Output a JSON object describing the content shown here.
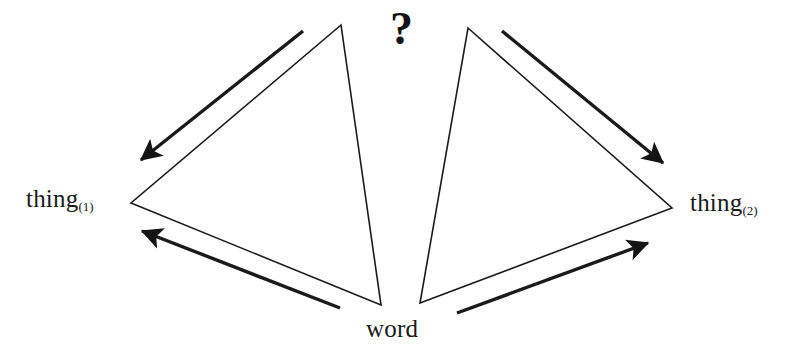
{
  "diagram": {
    "type": "dual-triangle-reference-diagram",
    "background_color": "#ffffff",
    "stroke_color": "#1a1a1a",
    "nodes": {
      "thing1": {
        "base": "thing",
        "subscript": "(1)",
        "full": "thing(1)"
      },
      "thing2": {
        "base": "thing",
        "subscript": "(2)",
        "full": "thing(2)"
      },
      "word": {
        "base": "word"
      },
      "question": {
        "symbol": "?"
      }
    },
    "thin_triangles": [
      {
        "name": "left-triangle",
        "points": "341,25 131,203 381,305"
      },
      {
        "name": "right-triangle",
        "points": "468,28 672,208 420,303"
      }
    ],
    "arrows": [
      {
        "name": "arrow-upper-left",
        "from": "word-apex",
        "to": "thing1",
        "x1": 303,
        "y1": 31,
        "x2": 141,
        "y2": 160
      },
      {
        "name": "arrow-lower-left",
        "from": "word",
        "to": "thing1",
        "x1": 340,
        "y1": 308,
        "x2": 142,
        "y2": 231
      },
      {
        "name": "arrow-upper-right",
        "from": "word-apex",
        "to": "thing2",
        "x1": 502,
        "y1": 31,
        "x2": 663,
        "y2": 163
      },
      {
        "name": "arrow-lower-right",
        "from": "word",
        "to": "thing2",
        "x1": 457,
        "y1": 313,
        "x2": 648,
        "y2": 243
      }
    ]
  }
}
